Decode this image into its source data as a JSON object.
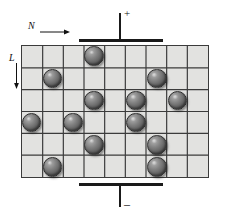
{
  "figure": {
    "background_color": "#ffffff",
    "width": 225,
    "height": 216
  },
  "annotations": {
    "horizontal_axis": {
      "label": "N",
      "arrow": "right-arrow",
      "arrow_glyph": "→"
    },
    "vertical_axis": {
      "label": "L",
      "arrow": "down-arrow",
      "arrow_glyph": "↓"
    }
  },
  "electrodes": {
    "top": {
      "sign": "+",
      "name": "positive-electrode",
      "color": "#1a1a1a"
    },
    "bottom": {
      "sign": "–",
      "name": "negative-electrode",
      "color": "#1a1a1a"
    }
  },
  "grid": {
    "columns": 9,
    "rows": 6,
    "cell_fill": "#e2e2e0",
    "line_color": "#3b3b3b",
    "border_color": "#3b3b3b"
  },
  "chart_data": {
    "type": "heatmap",
    "xlabel": "N",
    "ylabel": "L",
    "grid": true,
    "legend": "none",
    "columns": 9,
    "rows": 6,
    "marker": "sphere",
    "marker_color": "#6a6a6a",
    "occupied_cells": [
      {
        "row": 1,
        "col": 4
      },
      {
        "row": 2,
        "col": 2
      },
      {
        "row": 2,
        "col": 7
      },
      {
        "row": 3,
        "col": 4
      },
      {
        "row": 3,
        "col": 6
      },
      {
        "row": 3,
        "col": 8
      },
      {
        "row": 4,
        "col": 1
      },
      {
        "row": 4,
        "col": 3
      },
      {
        "row": 4,
        "col": 6
      },
      {
        "row": 5,
        "col": 4
      },
      {
        "row": 5,
        "col": 7
      },
      {
        "row": 6,
        "col": 2
      },
      {
        "row": 6,
        "col": 7
      }
    ],
    "total_particles": 13
  }
}
